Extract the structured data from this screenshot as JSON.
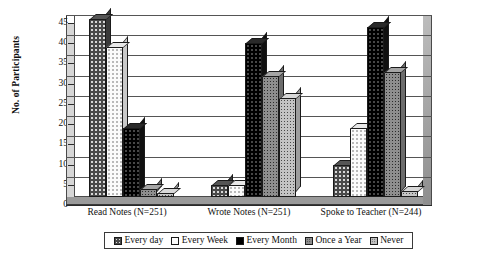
{
  "chart_data": {
    "type": "bar",
    "title": "",
    "xlabel": "",
    "ylabel": "No. of Participants",
    "ylim": [
      0,
      45
    ],
    "ytick_step": 5,
    "yticks": [
      "45",
      "40",
      "35",
      "30",
      "25",
      "20",
      "15",
      "10",
      "5",
      "0"
    ],
    "grid": true,
    "legend_position": "bottom",
    "categories": [
      "Read Notes (N=251)",
      "Wrote Notes (N=251)",
      "Spoke to Teacher (N=244)"
    ],
    "series": [
      {
        "name": "Every day",
        "values": [
          44,
          3,
          8
        ]
      },
      {
        "name": "Every Week",
        "values": [
          37,
          3,
          17
        ]
      },
      {
        "name": "Every Month",
        "values": [
          17,
          38,
          42
        ]
      },
      {
        "name": "Once a Year",
        "values": [
          2,
          30,
          31
        ]
      },
      {
        "name": "Never",
        "values": [
          1,
          24.5,
          1.5
        ]
      }
    ]
  },
  "axis": {
    "y_title": "No. of Participants"
  },
  "legend": {
    "items": [
      {
        "label": "Every day",
        "swatch": "dark-dotted-swatch"
      },
      {
        "label": "Every Week",
        "swatch": "white-swatch"
      },
      {
        "label": "Every Month",
        "swatch": "black-swatch"
      },
      {
        "label": "Once a Year",
        "swatch": "gray-dotted-swatch"
      },
      {
        "label": "Never",
        "swatch": "light-gray-dotted-swatch"
      }
    ]
  }
}
